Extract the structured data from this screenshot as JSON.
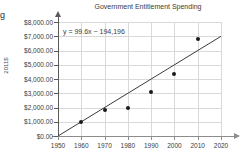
{
  "edge_fragment": "g",
  "chart_data": {
    "type": "scatter",
    "title": "Government Entitlement Spending",
    "xlabel": "",
    "ylabel": "2011$",
    "xlim": [
      1950,
      2020
    ],
    "ylim": [
      0,
      8000
    ],
    "grid": true,
    "legend": "none",
    "annotation": "y = 99.6x − 194,196",
    "trendline": {
      "slope": 99.6,
      "intercept": -194196,
      "x_start": 1950,
      "y_start": 0,
      "x_end": 2020,
      "y_end": 6996
    },
    "x": [
      1960,
      1970,
      1980,
      1990,
      2000,
      2010
    ],
    "values": [
      950,
      1800,
      2000,
      3070,
      4350,
      6800
    ],
    "points": [
      {
        "x": 1960,
        "y": 950
      },
      {
        "x": 1970,
        "y": 1800
      },
      {
        "x": 1980,
        "y": 2000
      },
      {
        "x": 1990,
        "y": 3070
      },
      {
        "x": 2000,
        "y": 4350
      },
      {
        "x": 2010,
        "y": 6800
      }
    ],
    "y_tick_labels": [
      "$8,000.00",
      "$7,000.00",
      "$6,000.00",
      "$5,000.00",
      "$4,000.00",
      "$3,000.00",
      "$2,000.00",
      "$1,000.00",
      "$0.00"
    ],
    "y_tick_values": [
      8000,
      7000,
      6000,
      5000,
      4000,
      3000,
      2000,
      1000,
      0
    ],
    "x_tick_labels": [
      "1950",
      "1960",
      "1970",
      "1980",
      "1990",
      "2000",
      "2010",
      "2020"
    ],
    "x_tick_values": [
      1950,
      1960,
      1970,
      1980,
      1990,
      2000,
      2010,
      2020
    ],
    "colors": {
      "point": "#1a1a1a",
      "trendline": "#3b3b3b",
      "gridline": "#d9d9d9",
      "axis": "#5a5a5a",
      "text": "#3b3b3b",
      "background": "#ffffff"
    }
  }
}
